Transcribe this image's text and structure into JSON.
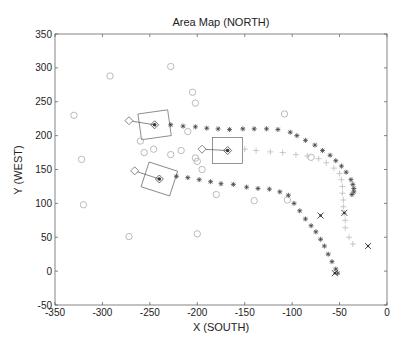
{
  "chart_data": {
    "type": "scatter",
    "title": "Area Map (NORTH)",
    "xlabel": "X (SOUTH)",
    "ylabel": "Y (WEST)",
    "xlim": [
      -350,
      0
    ],
    "ylim": [
      -50,
      350
    ],
    "xticks": [
      -350,
      -300,
      -250,
      -200,
      -150,
      -100,
      -50,
      0
    ],
    "yticks": [
      -50,
      0,
      50,
      100,
      150,
      200,
      250,
      300,
      350
    ],
    "grid": false,
    "legend": null,
    "series": [
      {
        "name": "landmarks",
        "marker": "circle",
        "color": "#aaaaaa",
        "points": [
          [
            -330,
            230
          ],
          [
            -292,
            288
          ],
          [
            -322,
            165
          ],
          [
            -320,
            98
          ],
          [
            -228,
            302
          ],
          [
            -205,
            264
          ],
          [
            -202,
            248
          ],
          [
            -272,
            51
          ],
          [
            -200,
            55
          ],
          [
            -256,
            175
          ],
          [
            -246,
            180
          ],
          [
            -260,
            192
          ],
          [
            -228,
            172
          ],
          [
            -217,
            178
          ],
          [
            -202,
            167
          ],
          [
            -200,
            162
          ],
          [
            -195,
            150
          ],
          [
            -180,
            113
          ],
          [
            -140,
            104
          ],
          [
            -108,
            232
          ],
          [
            -105,
            105
          ],
          [
            -80,
            168
          ],
          [
            -210,
            206
          ]
        ]
      },
      {
        "name": "track-1",
        "marker": "star",
        "color": "#444444",
        "points": [
          [
            -228,
            216
          ],
          [
            -215,
            214
          ],
          [
            -202,
            213
          ],
          [
            -190,
            211
          ],
          [
            -178,
            210
          ],
          [
            -166,
            209
          ],
          [
            -152,
            210
          ],
          [
            -140,
            210
          ],
          [
            -127,
            210
          ],
          [
            -115,
            209
          ],
          [
            -102,
            205
          ],
          [
            -95,
            200
          ],
          [
            -86,
            193
          ],
          [
            -76,
            186
          ],
          [
            -68,
            178
          ],
          [
            -60,
            171
          ],
          [
            -54,
            163
          ],
          [
            -48,
            155
          ],
          [
            -43,
            146
          ],
          [
            -38,
            135
          ],
          [
            -36,
            128
          ],
          [
            -35,
            122
          ],
          [
            -35,
            117
          ],
          [
            -37,
            113
          ]
        ]
      },
      {
        "name": "track-2",
        "marker": "plus",
        "color": "#bbbbbb",
        "points": [
          [
            -150,
            180
          ],
          [
            -138,
            178
          ],
          [
            -123,
            176
          ],
          [
            -110,
            175
          ],
          [
            -96,
            172
          ],
          [
            -84,
            170
          ],
          [
            -72,
            166
          ],
          [
            -64,
            160
          ],
          [
            -56,
            152
          ],
          [
            -50,
            144
          ],
          [
            -48,
            135
          ],
          [
            -47,
            125
          ],
          [
            -47,
            115
          ],
          [
            -46,
            105
          ],
          [
            -46,
            95
          ],
          [
            -45,
            85
          ],
          [
            -44,
            75
          ],
          [
            -44,
            64
          ],
          [
            -40,
            50
          ],
          [
            -36,
            40
          ]
        ]
      },
      {
        "name": "track-3",
        "marker": "star",
        "color": "#444444",
        "points": [
          [
            -222,
            140
          ],
          [
            -210,
            138
          ],
          [
            -198,
            135
          ],
          [
            -186,
            132
          ],
          [
            -175,
            129
          ],
          [
            -162,
            128
          ],
          [
            -148,
            124
          ],
          [
            -136,
            122
          ],
          [
            -124,
            121
          ],
          [
            -113,
            117
          ],
          [
            -104,
            112
          ],
          [
            -98,
            100
          ],
          [
            -92,
            89
          ],
          [
            -86,
            77
          ],
          [
            -80,
            67
          ],
          [
            -75,
            58
          ],
          [
            -70,
            47
          ],
          [
            -66,
            37
          ],
          [
            -62,
            25
          ],
          [
            -58,
            14
          ],
          [
            -54,
            3
          ],
          [
            -52,
            -3
          ]
        ]
      },
      {
        "name": "x-markers",
        "marker": "x",
        "color": "#333333",
        "points": [
          [
            -70,
            82
          ],
          [
            -45,
            86
          ],
          [
            -20,
            37
          ],
          [
            -55,
            -3
          ]
        ]
      }
    ],
    "annotations": [
      {
        "type": "diamond-start",
        "points": [
          [
            -272,
            222
          ],
          [
            -195,
            180
          ],
          [
            -266,
            148
          ]
        ]
      },
      {
        "type": "vehicle-box",
        "centers": [
          [
            -245,
            216
          ],
          [
            -168,
            178
          ],
          [
            -240,
            136
          ]
        ],
        "width_units": 30,
        "height_units": 40
      }
    ]
  }
}
